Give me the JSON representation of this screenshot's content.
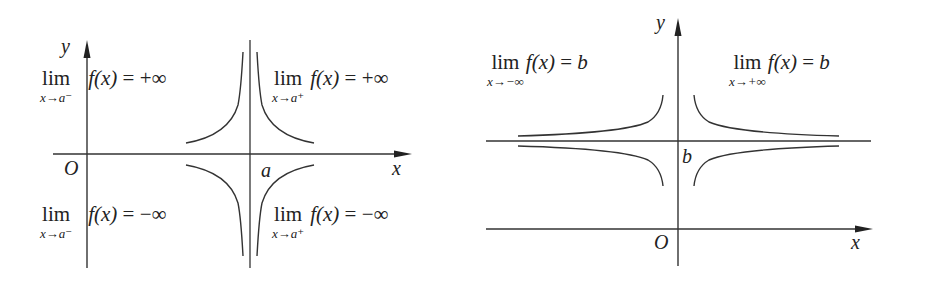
{
  "left_diagram": {
    "axis_labels": {
      "x": "x",
      "y": "y",
      "origin": "O",
      "asymptote_point": "a"
    },
    "annotations": {
      "top_left": {
        "op": "lim",
        "sub": "x→a⁻",
        "func": "f(x)",
        "rel": "=",
        "value": "+∞"
      },
      "top_right": {
        "op": "lim",
        "sub": "x→a⁺",
        "func": "f(x)",
        "rel": "=",
        "value": "+∞"
      },
      "bottom_left": {
        "op": "lim",
        "sub": "x→a⁻",
        "func": "f(x)",
        "rel": "=",
        "value": "−∞"
      },
      "bottom_right": {
        "op": "lim",
        "sub": "x→a⁺",
        "func": "f(x)",
        "rel": "=",
        "value": "−∞"
      }
    },
    "description": "Vertical asymptote x = a"
  },
  "right_diagram": {
    "axis_labels": {
      "x": "x",
      "y": "y",
      "origin": "O",
      "asymptote_value": "b"
    },
    "annotations": {
      "left": {
        "op": "lim",
        "sub": "x→−∞",
        "func": "f(x)",
        "rel": "=",
        "value": "b"
      },
      "right": {
        "op": "lim",
        "sub": "x→+∞",
        "func": "f(x)",
        "rel": "=",
        "value": "b"
      }
    },
    "description": "Horizontal asymptote y = b"
  },
  "colors": {
    "stroke": "#333333",
    "background": "#ffffff"
  }
}
